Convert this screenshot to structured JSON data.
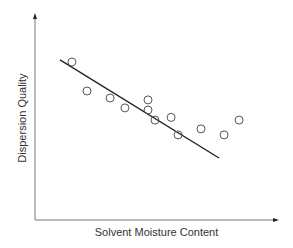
{
  "chart_data": {
    "type": "scatter",
    "title": "",
    "xlabel": "Solvent Moisture Content",
    "ylabel": "Dispersion Quality",
    "xlim": [
      0,
      10
    ],
    "ylim": [
      0,
      10
    ],
    "grid": false,
    "ticks": false,
    "legend": null,
    "series": [
      {
        "name": "observations",
        "marker": "open-circle",
        "x": [
          1.52,
          2.14,
          3.09,
          3.7,
          4.65,
          4.65,
          4.94,
          5.6,
          5.89,
          6.83,
          7.78,
          8.4
        ],
        "y": [
          7.67,
          6.26,
          5.92,
          5.44,
          5.83,
          5.34,
          4.85,
          4.98,
          4.13,
          4.42,
          4.13,
          4.85
        ]
      },
      {
        "name": "trend line",
        "type": "line",
        "x": [
          1.03,
          7.57
        ],
        "y": [
          7.77,
          3.01
        ]
      }
    ],
    "colors": {
      "axis": "#555555",
      "marker": "#555555",
      "trend": "#222222"
    }
  }
}
